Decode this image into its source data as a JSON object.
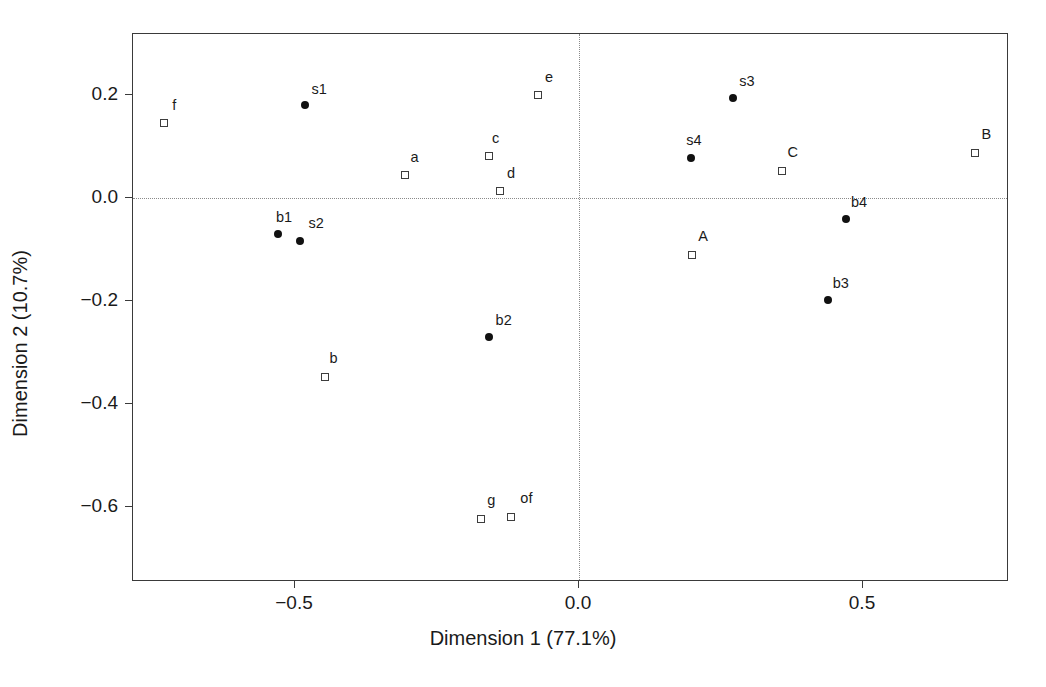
{
  "chart_data": {
    "type": "scatter",
    "title": "",
    "xlabel": "Dimension 1 (77.1%)",
    "ylabel": "Dimension 2 (10.7%)",
    "xlim": [
      -0.785,
      0.757
    ],
    "ylim": [
      -0.693,
      0.318
    ],
    "xticks": [
      -0.5,
      0.0,
      0.5
    ],
    "xticklabels": [
      "−0.5",
      "0.0",
      "0.5"
    ],
    "yticks": [
      0.2,
      0.0,
      -0.2,
      -0.4,
      -0.6
    ],
    "yticklabels": [
      "0.2",
      "0.0",
      "−0.2",
      "−0.4",
      "−0.6"
    ],
    "grid": false,
    "reference_lines": {
      "horizontal": 0.0,
      "vertical": 0.0
    },
    "legend": null,
    "series": [
      {
        "name": "filled-points",
        "marker": "filled-circle",
        "points": [
          {
            "label": "s1",
            "x": -0.482,
            "y": 0.181,
            "label_dx": 14,
            "label_dy": -16
          },
          {
            "label": "b1",
            "x": -0.53,
            "y": -0.07,
            "label_dx": 6,
            "label_dy": -17
          },
          {
            "label": "s2",
            "x": -0.491,
            "y": -0.083,
            "label_dx": 16,
            "label_dy": -18
          },
          {
            "label": "b2",
            "x": -0.159,
            "y": -0.27,
            "label_dx": 15,
            "label_dy": -17
          },
          {
            "label": "s3",
            "x": 0.271,
            "y": 0.195,
            "label_dx": 14,
            "label_dy": -17
          },
          {
            "label": "s4",
            "x": 0.197,
            "y": 0.078,
            "label_dx": 3,
            "label_dy": -18
          },
          {
            "label": "b4",
            "x": 0.47,
            "y": -0.041,
            "label_dx": 13,
            "label_dy": -17
          },
          {
            "label": "b3",
            "x": 0.438,
            "y": -0.198,
            "label_dx": 13,
            "label_dy": -17
          }
        ]
      },
      {
        "name": "open-points",
        "marker": "open-square",
        "points": [
          {
            "label": "f",
            "x": -0.73,
            "y": 0.145,
            "label_dx": 10,
            "label_dy": -18
          },
          {
            "label": "a",
            "x": -0.307,
            "y": 0.045,
            "label_dx": 10,
            "label_dy": -18
          },
          {
            "label": "c",
            "x": -0.159,
            "y": 0.081,
            "label_dx": 7,
            "label_dy": -18
          },
          {
            "label": "d",
            "x": -0.139,
            "y": 0.014,
            "label_dx": 11,
            "label_dy": -18
          },
          {
            "label": "e",
            "x": -0.072,
            "y": 0.2,
            "label_dx": 11,
            "label_dy": -18
          },
          {
            "label": "b",
            "x": -0.448,
            "y": -0.347,
            "label_dx": 9,
            "label_dy": -19
          },
          {
            "label": "g",
            "x": -0.172,
            "y": -0.624,
            "label_dx": 10,
            "label_dy": -19
          },
          {
            "label": "of",
            "x": -0.119,
            "y": -0.62,
            "label_dx": 15,
            "label_dy": -19
          },
          {
            "label": "A",
            "x": 0.199,
            "y": -0.111,
            "label_dx": 11,
            "label_dy": -19
          },
          {
            "label": "C",
            "x": 0.357,
            "y": 0.053,
            "label_dx": 11,
            "label_dy": -19
          },
          {
            "label": "B",
            "x": 0.698,
            "y": 0.088,
            "label_dx": 11,
            "label_dy": -19
          }
        ]
      }
    ]
  },
  "axes": {
    "xlabel": "Dimension 1 (77.1%)",
    "ylabel": "Dimension 2 (10.7%)"
  }
}
